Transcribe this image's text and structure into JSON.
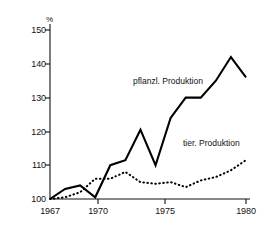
{
  "chart_data": {
    "type": "line",
    "title": "",
    "subtitle": "",
    "xlabel": "",
    "ylabel": "%",
    "unit_symbol": "%",
    "x": [
      1967,
      1968,
      1969,
      1970,
      1971,
      1972,
      1973,
      1974,
      1975,
      1976,
      1977,
      1978,
      1979,
      1980
    ],
    "xlim": [
      1967,
      1980
    ],
    "ylim": [
      100,
      150
    ],
    "grid": false,
    "legend": "inline-annotations",
    "y_ticks": [
      100,
      110,
      120,
      130,
      140,
      150
    ],
    "y_tick_labels": [
      "100",
      "110",
      "120",
      "130",
      "140",
      "150"
    ],
    "x_ticks": [
      1967,
      1970,
      1975,
      1980
    ],
    "x_tick_labels": [
      "1967",
      "1970",
      "1975",
      "1980"
    ],
    "series": [
      {
        "name": "pflanzl. Produktion",
        "style": "solid",
        "color": "#000000",
        "values": [
          100,
          103,
          104,
          100.5,
          110,
          111.5,
          120.5,
          110,
          124,
          130,
          130,
          135,
          142,
          136
        ]
      },
      {
        "name": "tier. Produktion",
        "style": "dotted",
        "color": "#000000",
        "values": [
          100,
          100.5,
          102,
          106,
          106,
          108,
          105,
          104.5,
          105,
          103.5,
          105.5,
          106.5,
          108.5,
          111.5
        ]
      }
    ],
    "annotations": [
      {
        "text": "pflanzl. Produktion",
        "x_px": 133,
        "y_px": 80
      },
      {
        "text": "tier. Produktion",
        "x_px": 183,
        "y_px": 142
      }
    ]
  }
}
